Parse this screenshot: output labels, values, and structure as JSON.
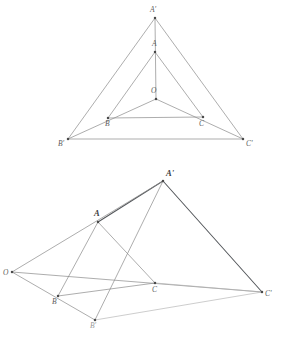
{
  "figure": {
    "background_color": "#ffffff",
    "line_color": "#8a8a8a",
    "strong_line_color": "#55585c",
    "faint_line_color": "#b2b2b2",
    "label_color": "#5c5c5c",
    "width": 284,
    "height": 339
  },
  "upper_diagram": {
    "name": "plane-perspective-triangles",
    "description": "Triangle ABC and triangle A'B'C' in perspective from center O, drawn in one plane",
    "points": [
      {
        "id": "A-prime",
        "label": "A'",
        "x": 155,
        "y": 18,
        "label_x": 150,
        "label_y": 12,
        "style": "plain"
      },
      {
        "id": "A",
        "label": "A",
        "x": 155,
        "y": 52,
        "label_x": 152,
        "label_y": 46,
        "style": "plain"
      },
      {
        "id": "O",
        "label": "O",
        "x": 156,
        "y": 99,
        "label_x": 151,
        "label_y": 93,
        "style": "plain"
      },
      {
        "id": "B",
        "label": "B",
        "x": 108,
        "y": 118,
        "label_x": 105,
        "label_y": 126,
        "style": "plain"
      },
      {
        "id": "C",
        "label": "C",
        "x": 203,
        "y": 117,
        "label_x": 199,
        "label_y": 126,
        "style": "plain"
      },
      {
        "id": "B-prime",
        "label": "B'",
        "x": 68,
        "y": 139,
        "label_x": 58,
        "label_y": 146,
        "style": "plain"
      },
      {
        "id": "C-prime",
        "label": "C'",
        "x": 243,
        "y": 139,
        "label_x": 246,
        "label_y": 146,
        "style": "plain"
      }
    ],
    "edges": [
      {
        "id": "edge-Ap-Bp",
        "from": "A-prime",
        "to": "B-prime",
        "weight": "normal"
      },
      {
        "id": "edge-Ap-Cp",
        "from": "A-prime",
        "to": "C-prime",
        "weight": "normal"
      },
      {
        "id": "edge-Bp-Cp",
        "from": "B-prime",
        "to": "C-prime",
        "weight": "normal"
      },
      {
        "id": "edge-A-B",
        "from": "A",
        "to": "B",
        "weight": "normal"
      },
      {
        "id": "edge-A-C",
        "from": "A",
        "to": "C",
        "weight": "normal"
      },
      {
        "id": "edge-B-C",
        "from": "B",
        "to": "C",
        "weight": "normal"
      },
      {
        "id": "ray-O-Ap",
        "from": "O",
        "to": "A-prime",
        "weight": "normal"
      },
      {
        "id": "ray-O-Bp",
        "from": "O",
        "to": "B-prime",
        "weight": "normal"
      },
      {
        "id": "ray-O-Cp",
        "from": "O",
        "to": "C-prime",
        "weight": "normal"
      }
    ]
  },
  "lower_diagram": {
    "name": "spatial-perspective-triangles",
    "description": "Triangle ABC and triangle A'B'C' in perspective from external point O, drawn in space",
    "points": [
      {
        "id": "A-prime",
        "label": "A'",
        "x": 163,
        "y": 181,
        "label_x": 166,
        "label_y": 176,
        "style": "bold"
      },
      {
        "id": "A",
        "label": "A",
        "x": 98,
        "y": 222,
        "label_x": 94,
        "label_y": 216,
        "style": "bold"
      },
      {
        "id": "O",
        "label": "O",
        "x": 12,
        "y": 272,
        "label_x": 3,
        "label_y": 275,
        "style": "plain"
      },
      {
        "id": "B",
        "label": "B",
        "x": 58,
        "y": 296,
        "label_x": 52,
        "label_y": 304,
        "style": "plain"
      },
      {
        "id": "C",
        "label": "C",
        "x": 155,
        "y": 283,
        "label_x": 152,
        "label_y": 292,
        "style": "plain"
      },
      {
        "id": "B-prime",
        "label": "B'",
        "x": 95,
        "y": 320,
        "label_x": 90,
        "label_y": 328,
        "style": "faint"
      },
      {
        "id": "C-prime",
        "label": "C'",
        "x": 262,
        "y": 292,
        "label_x": 265,
        "label_y": 296,
        "style": "plain"
      }
    ],
    "edges": [
      {
        "id": "edge-A-Ap",
        "from": "A",
        "to": "A-prime",
        "weight": "strong"
      },
      {
        "id": "edge-Ap-Cp",
        "from": "A-prime",
        "to": "C-prime",
        "weight": "strong"
      },
      {
        "id": "edge-Ap-Bp",
        "from": "A-prime",
        "to": "B-prime",
        "weight": "normal"
      },
      {
        "id": "edge-A-B",
        "from": "A",
        "to": "B",
        "weight": "normal"
      },
      {
        "id": "edge-A-C",
        "from": "A",
        "to": "C",
        "weight": "normal"
      },
      {
        "id": "edge-B-C",
        "from": "B",
        "to": "C",
        "weight": "normal"
      },
      {
        "id": "ray-O-Ap",
        "from": "O",
        "to": "A-prime",
        "weight": "normal"
      },
      {
        "id": "ray-O-Bp",
        "from": "O",
        "to": "B-prime",
        "weight": "normal"
      },
      {
        "id": "ray-O-Cp",
        "from": "O",
        "to": "C-prime",
        "weight": "normal"
      },
      {
        "id": "edge-Bp-Cp",
        "from": "B-prime",
        "to": "C-prime",
        "weight": "faint"
      },
      {
        "id": "edge-C-Cp",
        "from": "C",
        "to": "C-prime",
        "weight": "faint"
      }
    ]
  }
}
